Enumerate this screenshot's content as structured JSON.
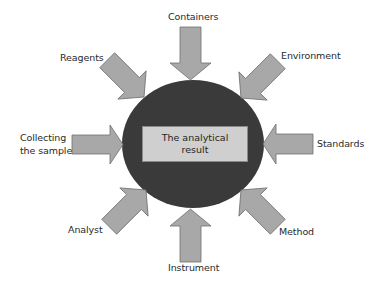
{
  "diagram": {
    "center": {
      "line1": "The analytical",
      "line2": "result"
    },
    "factors": [
      {
        "id": "containers",
        "label": "Containers",
        "direction": "top"
      },
      {
        "id": "environment",
        "label": "Environment",
        "direction": "top-right"
      },
      {
        "id": "standards",
        "label": "Standards",
        "direction": "right"
      },
      {
        "id": "method",
        "label": "Method",
        "direction": "bottom-right"
      },
      {
        "id": "instrument",
        "label": "Instrument",
        "direction": "bottom"
      },
      {
        "id": "analyst",
        "label": "Analyst",
        "direction": "bottom-left"
      },
      {
        "id": "collecting",
        "label_line1": "Collecting",
        "label_line2": "the sample",
        "direction": "left"
      },
      {
        "id": "reagents",
        "label": "Reagents",
        "direction": "top-left"
      }
    ],
    "colors": {
      "circle": "#3a3a3a",
      "arrow_fill": "#a8a8a8",
      "arrow_stroke": "#6e6e6e",
      "box_fill": "#cfcfcf",
      "text": "#2a2a2a"
    }
  }
}
